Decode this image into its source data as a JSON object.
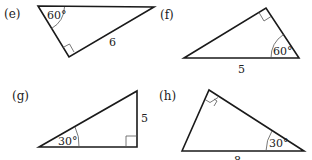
{
  "figures": [
    {
      "id": "e",
      "label": "(e)",
      "angle_label": "60°",
      "angle_vertex": "top-left",
      "right_angle_vertex": "bottom",
      "side_label": "6",
      "side": "hypotenuse-adjacent (bottom to top-right)"
    },
    {
      "id": "f",
      "label": "(f)",
      "angle_label": "60°",
      "angle_vertex": "bottom-right",
      "right_angle_vertex": "top",
      "side_label": "5",
      "side": "base (hypotenuse)"
    },
    {
      "id": "g",
      "label": "(g)",
      "angle_label": "30°",
      "angle_vertex": "bottom-left",
      "right_angle_vertex": "bottom-right",
      "side_label": "5",
      "side": "right vertical leg"
    },
    {
      "id": "h",
      "label": "(h)",
      "angle_label": "30°",
      "angle_vertex": "bottom-right",
      "right_angle_vertex": "top",
      "side_label": "8",
      "side": "base (hypotenuse)"
    }
  ]
}
